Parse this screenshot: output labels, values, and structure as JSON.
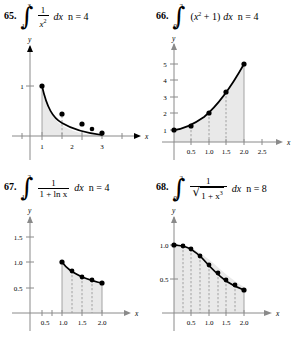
{
  "page": {
    "background": "#ffffff",
    "shade_color": "#e9e9e9",
    "curve_color": "#000000",
    "axis_color": "#8a8a8a"
  },
  "problems": [
    {
      "number": "65.",
      "integral": {
        "lower": "1",
        "upper": "3",
        "numerator": "1",
        "denominator_base": "x",
        "denominator_exp": "2",
        "differential": "dx",
        "partition": "n = 4"
      },
      "graph": {
        "x_axis_label": "x",
        "y_axis_label": "y",
        "x_ticks": [
          "1",
          "2",
          "3"
        ],
        "y_ticks": [
          "1"
        ],
        "points_x": [
          1,
          1.5,
          2,
          2.5,
          3
        ],
        "points_y": [
          1,
          0.4444,
          0.25,
          0.16,
          0.1111
        ],
        "xlim": [
          0,
          3.6
        ],
        "ylim": [
          0,
          1.35
        ],
        "dashed_interior": [
          1.5,
          2,
          2.5
        ]
      }
    },
    {
      "number": "66.",
      "integral": {
        "lower": "0",
        "upper": "2",
        "expression_base": "x",
        "expression_exp": "2",
        "expression_tail": "+ 1",
        "differential": "dx",
        "partition": "n = 4"
      },
      "graph": {
        "x_axis_label": "x",
        "y_axis_label": "y",
        "x_ticks": [
          "0.5",
          "1.0",
          "1.5",
          "2.0",
          "2.5"
        ],
        "y_ticks": [
          "1",
          "2",
          "3",
          "4",
          "5"
        ],
        "points_x": [
          0,
          0.5,
          1.0,
          1.5,
          2.0
        ],
        "points_y": [
          1,
          1.25,
          2,
          3.25,
          5
        ],
        "xlim": [
          0,
          2.8
        ],
        "ylim": [
          0,
          5.8
        ],
        "dashed_interior": [
          0.5,
          1.0,
          1.5
        ]
      }
    },
    {
      "number": "67.",
      "integral": {
        "lower": "1",
        "upper": "2",
        "numerator": "1",
        "denominator": "1 + ln x",
        "differential": "dx",
        "partition": "n = 4"
      },
      "graph": {
        "x_axis_label": "x",
        "y_axis_label": "y",
        "x_ticks": [
          "0.5",
          "1.0",
          "1.5",
          "2.0"
        ],
        "y_ticks": [
          "0.5",
          "1.0",
          "1.5"
        ],
        "points_x": [
          1.0,
          1.25,
          1.5,
          1.75,
          2.0
        ],
        "points_y": [
          1.0,
          0.818,
          0.712,
          0.641,
          0.591
        ],
        "xlim": [
          0,
          2.45
        ],
        "ylim": [
          0,
          1.85
        ],
        "dashed_interior": [
          1.25,
          1.5,
          1.75
        ]
      }
    },
    {
      "number": "68.",
      "integral": {
        "lower": "0",
        "upper": "2",
        "numerator": "1",
        "denominator_radicand": "1 + x",
        "denominator_radicand_exp": "3",
        "differential": "dx",
        "partition": "n = 8"
      },
      "graph": {
        "x_axis_label": "x",
        "y_axis_label": "y",
        "x_ticks": [
          "0.5",
          "1.0",
          "1.5",
          "2.0"
        ],
        "y_ticks": [
          "0.5",
          "1.0"
        ],
        "points_x": [
          0,
          0.25,
          0.5,
          0.75,
          1.0,
          1.25,
          1.5,
          1.75,
          2.0
        ],
        "points_y": [
          1.0,
          0.992,
          0.939,
          0.837,
          0.707,
          0.586,
          0.488,
          0.412,
          0.333
        ],
        "xlim": [
          0,
          2.4
        ],
        "ylim": [
          0,
          1.25
        ],
        "dashed_interior": [
          0.25,
          0.5,
          0.75,
          1.0,
          1.25,
          1.5,
          1.75
        ]
      }
    }
  ]
}
